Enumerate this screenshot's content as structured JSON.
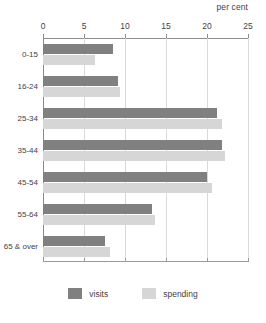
{
  "chart_data": {
    "type": "bar",
    "orientation": "horizontal",
    "title": "",
    "xlabel": "per cent",
    "ylabel": "",
    "xlim": [
      0,
      25
    ],
    "xticks": [
      0,
      5,
      10,
      15,
      20,
      25
    ],
    "grid": true,
    "legend_position": "bottom",
    "categories": [
      "0-15",
      "16-24",
      "25-34",
      "35-44",
      "45-54",
      "55-64",
      "65 & over"
    ],
    "series": [
      {
        "name": "visits",
        "color": "#808080",
        "values": [
          8.5,
          9.2,
          21.2,
          21.8,
          20.0,
          13.3,
          7.6
        ]
      },
      {
        "name": "spending",
        "color": "#d6d6d6",
        "values": [
          6.3,
          9.4,
          21.8,
          22.2,
          20.6,
          13.7,
          8.2
        ]
      }
    ]
  },
  "axis": {
    "unit_caption": "per cent",
    "tick_labels": [
      "0",
      "5",
      "10",
      "15",
      "20",
      "25"
    ]
  },
  "legend": {
    "items": [
      {
        "label": "visits",
        "color": "#808080"
      },
      {
        "label": "spending",
        "color": "#d6d6d6"
      }
    ]
  },
  "colors": {
    "visits": "#808080",
    "spending": "#d6d6d6",
    "axis": "#8c8c8c",
    "grid": "#d9d9d9",
    "text": "#3f3f3f",
    "background": "#ffffff"
  }
}
